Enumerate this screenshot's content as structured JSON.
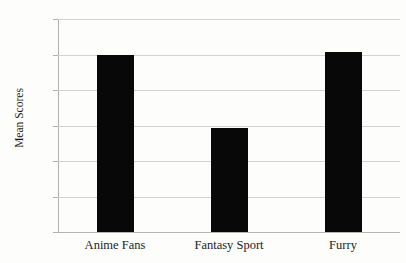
{
  "chart_data": {
    "type": "bar",
    "title": "",
    "xlabel": "",
    "ylabel": "Mean Scores",
    "categories": [
      "Anime Fans",
      "Fantasy Sport",
      "Furry"
    ],
    "values": [
      3.5,
      2.47,
      3.54
    ],
    "ylim": [
      1,
      4
    ],
    "yticks": [
      4,
      3.5,
      3,
      2.5,
      2,
      1.5,
      1
    ],
    "ytick_labels": [
      "4",
      "3.5",
      "3",
      "2.5",
      "2",
      "1.5",
      "1"
    ],
    "grid": true,
    "legend": "none",
    "bar_color": "#080808",
    "gridline_color": "#d2d2d2",
    "axis_color": "#b0b0b0",
    "background_color": "#fdfdfc"
  }
}
